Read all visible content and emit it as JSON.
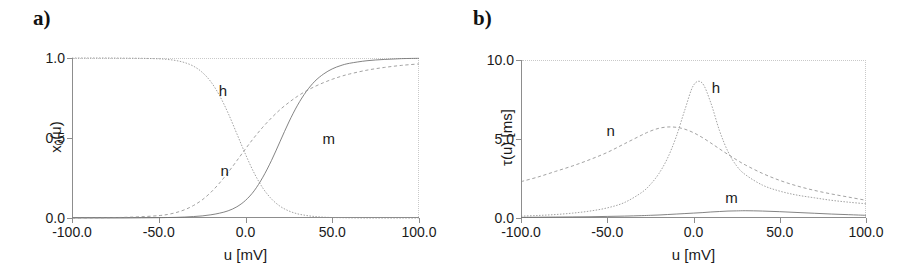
{
  "figure": {
    "panels": [
      {
        "id": "a",
        "label": "a)",
        "ylabel_main": "x",
        "ylabel_sub": "0",
        "ylabel_tail": "(u)",
        "xlabel": "u [mV]",
        "yticks": [
          "0.0",
          "0.5",
          "1.0"
        ],
        "ytick_values": [
          0.0,
          0.5,
          1.0
        ],
        "xticks": [
          "-100.0",
          "-50.0",
          "0.0",
          "50.0",
          "100.0"
        ],
        "xtick_values": [
          -100,
          -50,
          0,
          50,
          100
        ],
        "curve_tags": [
          {
            "text": "h",
            "x": -13,
            "y": 0.8
          },
          {
            "text": "n",
            "x": -12,
            "y": 0.3
          },
          {
            "text": "m",
            "x": 48,
            "y": 0.5
          }
        ]
      },
      {
        "id": "b",
        "label": "b)",
        "ylabel_main": "τ(u) [ms]",
        "xlabel": "u [mV]",
        "yticks": [
          "0.0",
          "5.0",
          "10.0"
        ],
        "ytick_values": [
          0.0,
          5.0,
          10.0
        ],
        "xticks": [
          "-100.0",
          "-50.0",
          "0.0",
          "50.0",
          "100.0"
        ],
        "xtick_values": [
          -100,
          -50,
          0,
          50,
          100
        ],
        "curve_tags": [
          {
            "text": "n",
            "x": -48,
            "y": 5.6
          },
          {
            "text": "h",
            "x": 13,
            "y": 8.3
          },
          {
            "text": "m",
            "x": 22,
            "y": 1.3
          }
        ]
      }
    ]
  },
  "chart_data": [
    {
      "type": "line",
      "panel": "a",
      "title": "",
      "xlabel": "u [mV]",
      "ylabel": "x_0(u)",
      "xlim": [
        -100,
        100
      ],
      "ylim": [
        0.0,
        1.0
      ],
      "grid": false,
      "legend": "inline-labels",
      "x": [
        -100,
        -90,
        -80,
        -70,
        -60,
        -50,
        -45,
        -40,
        -35,
        -30,
        -25,
        -20,
        -15,
        -10,
        -5,
        0,
        5,
        10,
        15,
        20,
        25,
        30,
        35,
        40,
        45,
        50,
        55,
        60,
        70,
        80,
        90,
        100
      ],
      "series": [
        {
          "name": "m",
          "style": "solid",
          "values": [
            0.0,
            0.0,
            0.0,
            0.0,
            0.001,
            0.002,
            0.003,
            0.004,
            0.006,
            0.009,
            0.013,
            0.02,
            0.03,
            0.045,
            0.07,
            0.11,
            0.17,
            0.255,
            0.36,
            0.48,
            0.6,
            0.705,
            0.79,
            0.855,
            0.9,
            0.932,
            0.953,
            0.967,
            0.983,
            0.991,
            0.996,
            0.998
          ]
        },
        {
          "name": "n",
          "style": "long-dash",
          "values": [
            0.0,
            0.001,
            0.002,
            0.004,
            0.008,
            0.015,
            0.022,
            0.034,
            0.052,
            0.078,
            0.113,
            0.16,
            0.218,
            0.285,
            0.358,
            0.432,
            0.503,
            0.568,
            0.626,
            0.678,
            0.722,
            0.761,
            0.794,
            0.822,
            0.846,
            0.867,
            0.885,
            0.9,
            0.924,
            0.941,
            0.954,
            0.963
          ]
        },
        {
          "name": "h",
          "style": "short-dash",
          "values": [
            1.0,
            1.0,
            1.0,
            0.999,
            0.998,
            0.995,
            0.991,
            0.984,
            0.971,
            0.949,
            0.911,
            0.852,
            0.766,
            0.655,
            0.527,
            0.398,
            0.281,
            0.187,
            0.119,
            0.073,
            0.044,
            0.026,
            0.016,
            0.009,
            0.005,
            0.003,
            0.002,
            0.001,
            0.0,
            0.0,
            0.0,
            0.0
          ]
        }
      ]
    },
    {
      "type": "line",
      "panel": "b",
      "title": "",
      "xlabel": "u [mV]",
      "ylabel": "tau(u) [ms]",
      "xlim": [
        -100,
        100
      ],
      "ylim": [
        0.0,
        10.0
      ],
      "grid": false,
      "legend": "inline-labels",
      "x": [
        -100,
        -90,
        -80,
        -70,
        -60,
        -50,
        -40,
        -30,
        -25,
        -20,
        -15,
        -10,
        -5,
        0,
        5,
        10,
        15,
        20,
        25,
        30,
        40,
        50,
        60,
        70,
        80,
        90,
        100
      ],
      "series": [
        {
          "name": "n",
          "style": "long-dash",
          "values": [
            2.3,
            2.6,
            2.95,
            3.3,
            3.7,
            4.15,
            4.7,
            5.25,
            5.5,
            5.68,
            5.76,
            5.74,
            5.62,
            5.4,
            5.1,
            4.75,
            4.38,
            4.02,
            3.68,
            3.36,
            2.82,
            2.38,
            2.03,
            1.75,
            1.52,
            1.32,
            1.12
          ]
        },
        {
          "name": "h",
          "style": "short-dash",
          "values": [
            0.12,
            0.16,
            0.22,
            0.31,
            0.44,
            0.64,
            0.98,
            1.62,
            2.12,
            2.82,
            3.8,
            5.15,
            6.85,
            8.4,
            8.55,
            7.3,
            5.55,
            4.2,
            3.3,
            2.75,
            2.08,
            1.7,
            1.45,
            1.28,
            1.12,
            1.0,
            0.9
          ]
        },
        {
          "name": "m",
          "style": "solid",
          "values": [
            0.04,
            0.05,
            0.06,
            0.07,
            0.08,
            0.1,
            0.12,
            0.15,
            0.17,
            0.19,
            0.22,
            0.25,
            0.28,
            0.31,
            0.34,
            0.38,
            0.41,
            0.44,
            0.45,
            0.46,
            0.44,
            0.4,
            0.35,
            0.3,
            0.25,
            0.21,
            0.17
          ]
        }
      ]
    }
  ]
}
